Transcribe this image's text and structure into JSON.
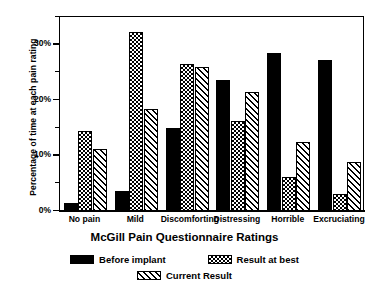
{
  "chart_data": {
    "type": "bar",
    "title": "",
    "xlabel": "McGill Pain Questionnaire Ratings",
    "ylabel": "Percentage of time at each pain rating",
    "categories": [
      "No pain",
      "Mild",
      "Discomforting",
      "Distressing",
      "Horrible",
      "Excruciating"
    ],
    "series": [
      {
        "name": "Before implant",
        "pattern": "solid",
        "values": [
          1.5,
          3.6,
          14.9,
          23.6,
          28.4,
          27.2
        ]
      },
      {
        "name": "Result at best",
        "pattern": "check",
        "values": [
          14.4,
          32.2,
          26.4,
          16.3,
          6.2,
          3.0
        ]
      },
      {
        "name": "Current Result",
        "pattern": "hatch",
        "values": [
          11.2,
          18.4,
          26.0,
          21.5,
          12.5,
          8.9
        ]
      }
    ],
    "ylim": [
      0,
      35
    ],
    "ytick_labels": [
      "0%",
      "10%",
      "20%",
      "30%"
    ],
    "ytick_values": [
      0,
      10,
      20,
      30
    ],
    "yminor_values": [
      5,
      15,
      25,
      35
    ],
    "grid": false,
    "legend_position": "bottom"
  },
  "legend": {
    "items": [
      {
        "label": "Before implant",
        "pattern": "solid"
      },
      {
        "label": "Result at best",
        "pattern": "check"
      },
      {
        "label": "Current Result",
        "pattern": "hatch"
      }
    ]
  }
}
